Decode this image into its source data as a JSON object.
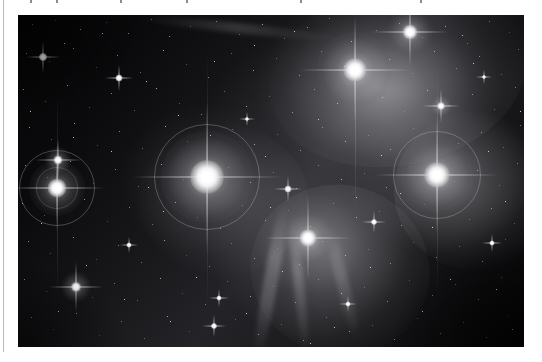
{
  "document": {
    "page_background": "#ffffff",
    "margin_rule_color": "#b9b9b9",
    "clipped_caption_marks": [
      30,
      56,
      120,
      186,
      300,
      420
    ]
  },
  "figure": {
    "name": "pleiades-astrophotograph",
    "frame": {
      "left": 18,
      "top": 15,
      "width": 506,
      "height": 332
    },
    "background_color": "#050506",
    "sky_gradient_note": "darkest at upper-left and lower-right corners; brightest nebulous glow across center and upper-right",
    "bright_stars": [
      {
        "name": "alcyone",
        "x": 189,
        "y": 162,
        "core": 30,
        "glow": 86,
        "ring": 104,
        "spike": 150,
        "intensity": 1.0
      },
      {
        "name": "atlas",
        "x": 419,
        "y": 160,
        "core": 22,
        "glow": 66,
        "ring": 86,
        "spike": 120,
        "intensity": 0.92
      },
      {
        "name": "maia",
        "x": 337,
        "y": 55,
        "core": 20,
        "glow": 60,
        "ring": 0,
        "spike": 106,
        "intensity": 0.9
      },
      {
        "name": "electra",
        "x": 39,
        "y": 173,
        "core": 16,
        "glow": 50,
        "ring": 74,
        "spike": 92,
        "intensity": 0.84
      },
      {
        "name": "merope",
        "x": 290,
        "y": 223,
        "core": 15,
        "glow": 46,
        "ring": 0,
        "spike": 86,
        "intensity": 0.82
      },
      {
        "name": "taygeta",
        "x": 392,
        "y": 17,
        "core": 13,
        "glow": 40,
        "ring": 0,
        "spike": 74,
        "intensity": 0.76
      },
      {
        "name": "pleione",
        "x": 58,
        "y": 272,
        "core": 9,
        "glow": 28,
        "ring": 0,
        "spike": 52,
        "intensity": 0.66
      },
      {
        "name": "celaeno",
        "x": 40,
        "y": 145,
        "core": 8,
        "glow": 24,
        "ring": 0,
        "spike": 44,
        "intensity": 0.62
      },
      {
        "name": "asterope",
        "x": 423,
        "y": 91,
        "core": 7,
        "glow": 20,
        "ring": 0,
        "spike": 36,
        "intensity": 0.58
      },
      {
        "name": "atlas-b",
        "x": 25,
        "y": 42,
        "core": 7,
        "glow": 20,
        "ring": 0,
        "spike": 36,
        "intensity": 0.58
      },
      {
        "name": "field-18",
        "x": 101,
        "y": 63,
        "core": 6,
        "glow": 17,
        "ring": 0,
        "spike": 30,
        "intensity": 0.52
      },
      {
        "name": "field-20",
        "x": 270,
        "y": 174,
        "core": 6,
        "glow": 16,
        "ring": 0,
        "spike": 30,
        "intensity": 0.52
      },
      {
        "name": "field-31",
        "x": 356,
        "y": 207,
        "core": 5,
        "glow": 14,
        "ring": 0,
        "spike": 26,
        "intensity": 0.48
      },
      {
        "name": "field-44",
        "x": 196,
        "y": 311,
        "core": 5,
        "glow": 14,
        "ring": 0,
        "spike": 26,
        "intensity": 0.48
      },
      {
        "name": "field-52",
        "x": 201,
        "y": 283,
        "core": 4,
        "glow": 12,
        "ring": 0,
        "spike": 22,
        "intensity": 0.44
      },
      {
        "name": "field-66",
        "x": 474,
        "y": 228,
        "core": 4,
        "glow": 12,
        "ring": 0,
        "spike": 22,
        "intensity": 0.44
      },
      {
        "name": "field-71",
        "x": 111,
        "y": 230,
        "core": 4,
        "glow": 11,
        "ring": 0,
        "spike": 20,
        "intensity": 0.42
      },
      {
        "name": "field-88",
        "x": 330,
        "y": 289,
        "core": 4,
        "glow": 11,
        "ring": 0,
        "spike": 20,
        "intensity": 0.42
      }
    ],
    "star_count_estimate": 900
  }
}
